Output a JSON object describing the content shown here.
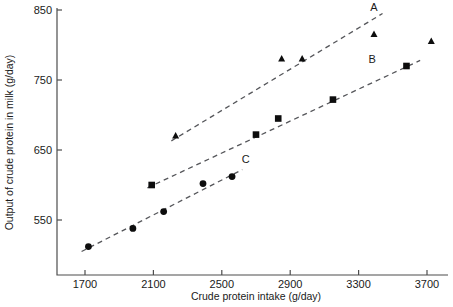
{
  "chart_data": {
    "type": "scatter",
    "title": "",
    "xlabel": "Crude protein intake (g/day)",
    "ylabel": "Output of crude protein in milk (g/day)",
    "xlim": [
      1600,
      3760
    ],
    "ylim": [
      495,
      858
    ],
    "xticks": [
      1700,
      2100,
      2500,
      2900,
      3300,
      3700
    ],
    "yticks": [
      550,
      650,
      750,
      850
    ],
    "xtick_labels": [
      "1700",
      "2100",
      "2500",
      "2900",
      "3300",
      "3700"
    ],
    "ytick_labels": [
      "550",
      "650",
      "750",
      "850"
    ],
    "grid": false,
    "legend_position": "inline-annotation",
    "series": [
      {
        "name": "A",
        "label": "A",
        "marker": "triangle",
        "color": "#0d0d0d",
        "points": [
          {
            "x": 2230,
            "y": 670
          },
          {
            "x": 2850,
            "y": 780
          },
          {
            "x": 2970,
            "y": 780
          },
          {
            "x": 3390,
            "y": 815
          },
          {
            "x": 3725,
            "y": 805
          }
        ],
        "trendline": {
          "x0": 2205,
          "y0": 663,
          "x1": 3440,
          "y1": 845
        },
        "label_pos": {
          "x": 3390,
          "y": 849
        }
      },
      {
        "name": "B",
        "label": "B",
        "marker": "square",
        "color": "#0d0d0d",
        "points": [
          {
            "x": 2090,
            "y": 600
          },
          {
            "x": 2700,
            "y": 672
          },
          {
            "x": 2830,
            "y": 695
          },
          {
            "x": 3150,
            "y": 722
          },
          {
            "x": 3580,
            "y": 770
          }
        ],
        "trendline": {
          "x0": 2065,
          "y0": 596,
          "x1": 3660,
          "y1": 778
        },
        "label_pos": {
          "x": 3380,
          "y": 775
        }
      },
      {
        "name": "C",
        "label": "C",
        "marker": "circle",
        "color": "#0d0d0d",
        "points": [
          {
            "x": 1720,
            "y": 512
          },
          {
            "x": 1980,
            "y": 538
          },
          {
            "x": 2160,
            "y": 562
          },
          {
            "x": 2390,
            "y": 602
          },
          {
            "x": 2560,
            "y": 612
          }
        ],
        "trendline": {
          "x0": 1680,
          "y0": 505,
          "x1": 2620,
          "y1": 622
        },
        "label_pos": {
          "x": 2640,
          "y": 632
        }
      }
    ]
  },
  "axes": {
    "x_axis_label": "Crude protein intake (g/day)",
    "y_axis_label": "Output of crude protein in milk (g/day)"
  }
}
